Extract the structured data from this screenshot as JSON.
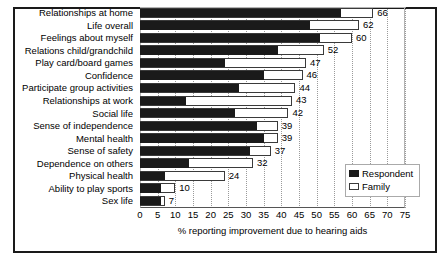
{
  "chart_data": {
    "type": "bar",
    "orientation": "horizontal",
    "title": "",
    "xlabel": "% reporting improvement due to hearing aids",
    "ylabel": "",
    "xlim": [
      0,
      75
    ],
    "xticks": [
      0,
      5,
      10,
      15,
      20,
      25,
      30,
      35,
      40,
      45,
      50,
      55,
      60,
      65,
      70,
      75
    ],
    "grid": true,
    "grid_axis": "x",
    "legend_position": "center-right",
    "categories": [
      "Relationships at home",
      "Life overall",
      "Feelings about myself",
      "Relations child/grandchild",
      "Play card/board games",
      "Confidence",
      "Participate group activities",
      "Relationships at work",
      "Social life",
      "Sense of independence",
      "Mental health",
      "Sense of safety",
      "Dependence on others",
      "Physical health",
      "Ability to play sports",
      "Sex life"
    ],
    "series": [
      {
        "name": "Respondent",
        "color": "#1a1a1a",
        "values": [
          57,
          48,
          51,
          39,
          24,
          35,
          28,
          13,
          27,
          33,
          35,
          31,
          14,
          7,
          6,
          6
        ]
      },
      {
        "name": "Family",
        "color": "#ffffff",
        "values": [
          66,
          62,
          60,
          52,
          47,
          46,
          44,
          43,
          42,
          39,
          39,
          37,
          32,
          24,
          10,
          7
        ]
      }
    ],
    "data_labels": [
      66,
      62,
      60,
      52,
      47,
      46,
      44,
      43,
      42,
      39,
      39,
      37,
      32,
      24,
      10,
      7
    ]
  },
  "legend": {
    "items": [
      {
        "label": "Respondent"
      },
      {
        "label": "Family"
      }
    ]
  }
}
